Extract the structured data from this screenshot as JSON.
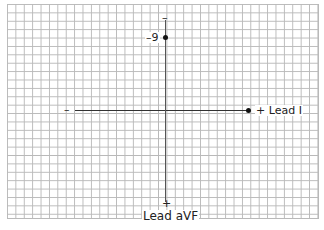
{
  "diagram": {
    "type": "ECG hexaxial lead axes",
    "horizontal_axis": {
      "name": "Lead I",
      "negative_label": "–",
      "positive_label": "+ Lead I"
    },
    "vertical_axis": {
      "name": "Lead aVF",
      "negative_label": "–",
      "positive_label": "+",
      "axis_label": "Lead aVF"
    },
    "points": [
      {
        "axis": "Lead aVF",
        "value_label": "–9"
      },
      {
        "axis": "Lead I",
        "value_label": ""
      }
    ],
    "colors": {
      "grid": "#b9b9b9",
      "axis": "#333333",
      "point": "#111111"
    }
  }
}
